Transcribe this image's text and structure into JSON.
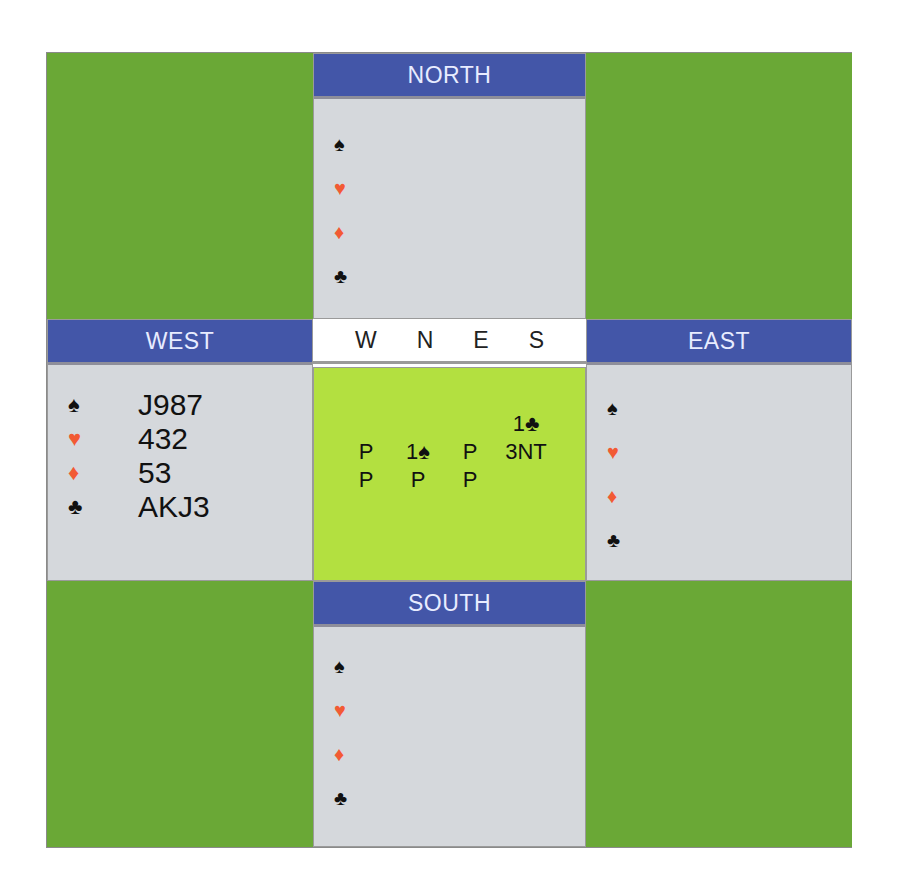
{
  "seats": {
    "north": {
      "label": "NORTH",
      "hand": {
        "spades": "",
        "hearts": "",
        "diamonds": "",
        "clubs": ""
      }
    },
    "west": {
      "label": "WEST",
      "hand": {
        "spades": "J987",
        "hearts": "432",
        "diamonds": "53",
        "clubs": "AKJ3"
      }
    },
    "east": {
      "label": "EAST",
      "hand": {
        "spades": "",
        "hearts": "",
        "diamonds": "",
        "clubs": ""
      }
    },
    "south": {
      "label": "SOUTH",
      "hand": {
        "spades": "",
        "hearts": "",
        "diamonds": "",
        "clubs": ""
      }
    }
  },
  "suits": {
    "spade": "♠",
    "heart": "♥",
    "diamond": "♦",
    "club": "♣"
  },
  "auction": {
    "headers": [
      "W",
      "N",
      "E",
      "S"
    ],
    "rows": [
      [
        "",
        "",
        "",
        "1♣"
      ],
      [
        "P",
        "1♠",
        "P",
        "3NT"
      ],
      [
        "P",
        "P",
        "P",
        ""
      ]
    ]
  },
  "colors": {
    "table_green": "#6aa836",
    "header_blue": "#4356a8",
    "hand_grey": "#d5d8dc",
    "auction_green": "#b3e040",
    "red_suit": "#f25a34"
  }
}
